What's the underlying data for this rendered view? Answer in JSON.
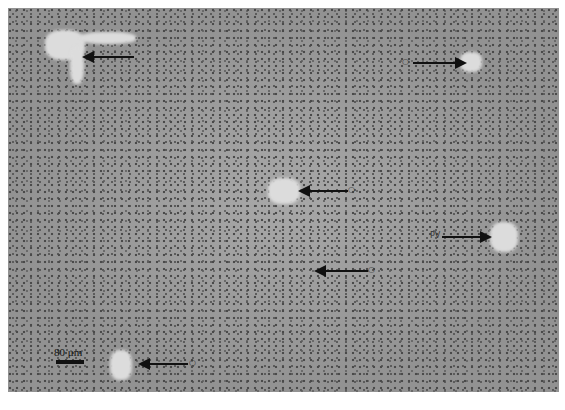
{
  "image": {
    "description": "Grayscale liver tissue micrograph with arrows pointing to vessels",
    "background_color": "#9a9a9a",
    "vessel_color": "#dcdcdc"
  },
  "scale_bar": {
    "label": "80 μm"
  },
  "annotations": [
    {
      "id": "arrow-top-left",
      "label": "",
      "direction": "left"
    },
    {
      "id": "arrow-top-right",
      "label": "○",
      "direction": "right"
    },
    {
      "id": "arrow-center",
      "label": "○",
      "direction": "left"
    },
    {
      "id": "arrow-right",
      "label": "PV",
      "direction": "right"
    },
    {
      "id": "arrow-lower-center",
      "label": "○",
      "direction": "left"
    },
    {
      "id": "arrow-bottom-left",
      "label": "○",
      "direction": "left"
    }
  ]
}
